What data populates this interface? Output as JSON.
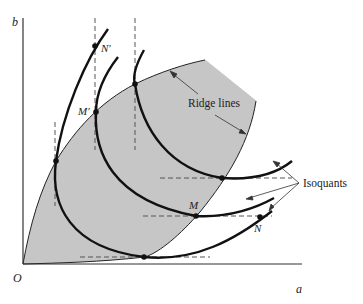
{
  "diagram": {
    "axes": {
      "x_label": "a",
      "y_label": "b",
      "origin_label": "O"
    },
    "labels": {
      "ridge_lines": "Ridge lines",
      "isoquants": "Isoquants",
      "point_M": "M",
      "point_N": "N",
      "point_M_prime": "M′",
      "point_N_prime": "N′"
    },
    "colors": {
      "shaded_region": "#c6c6c6",
      "curve": "#111111",
      "dashed": "#555555",
      "axis": "#333333",
      "background": "#ffffff"
    },
    "isoquant_count": 3,
    "points": [
      {
        "name": "M",
        "x": 196,
        "y": 216
      },
      {
        "name": "N",
        "x": 260,
        "y": 217
      },
      {
        "name": "M′",
        "x": 96,
        "y": 112
      },
      {
        "name": "N′",
        "x": 95,
        "y": 46
      }
    ]
  }
}
